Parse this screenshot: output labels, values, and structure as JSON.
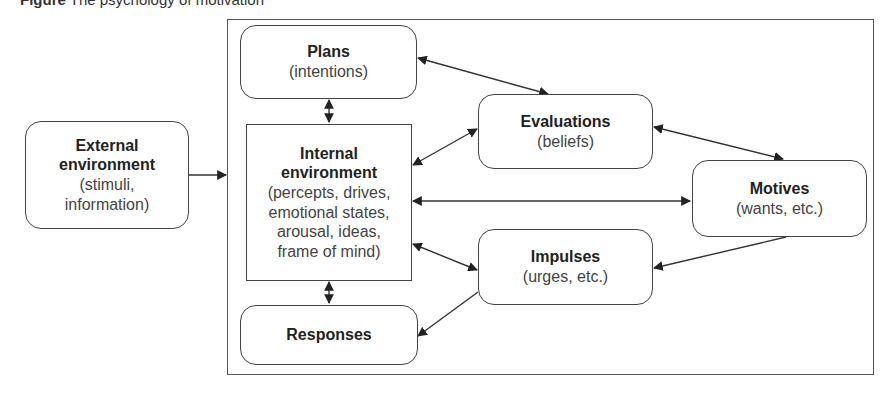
{
  "figure": {
    "title_prefix": "Figure",
    "title_text": "The psychology of motivation"
  },
  "nodes": {
    "external": {
      "heading": "External",
      "heading2": "environment",
      "sub1": "(stimuli,",
      "sub2": "information)"
    },
    "plans": {
      "heading": "Plans",
      "sub1": "(intentions)"
    },
    "internal": {
      "heading": "Internal",
      "heading2": "environment",
      "sub1": "(percepts, drives,",
      "sub2": "emotional states,",
      "sub3": "arousal, ideas,",
      "sub4": "frame of mind)"
    },
    "evaluations": {
      "heading": "Evaluations",
      "sub1": "(beliefs)"
    },
    "motives": {
      "heading": "Motives",
      "sub1": "(wants, etc.)"
    },
    "impulses": {
      "heading": "Impulses",
      "sub1": "(urges, etc.)"
    },
    "responses": {
      "heading": "Responses"
    }
  },
  "edges": [
    {
      "from": "External environment",
      "to": "Internal environment",
      "type": "one-way"
    },
    {
      "from": "Plans",
      "to": "Internal environment",
      "type": "two-way"
    },
    {
      "from": "Plans",
      "to": "Evaluations",
      "type": "two-way"
    },
    {
      "from": "Internal environment",
      "to": "Evaluations",
      "type": "two-way"
    },
    {
      "from": "Evaluations",
      "to": "Motives",
      "type": "two-way"
    },
    {
      "from": "Internal environment",
      "to": "Motives",
      "type": "two-way"
    },
    {
      "from": "Internal environment",
      "to": "Impulses",
      "type": "two-way"
    },
    {
      "from": "Motives",
      "to": "Impulses",
      "type": "one-way"
    },
    {
      "from": "Impulses",
      "to": "Responses",
      "type": "one-way"
    },
    {
      "from": "Internal environment",
      "to": "Responses",
      "type": "two-way"
    }
  ],
  "colors": {
    "stroke": "#444444",
    "text": "#222222",
    "background": "#ffffff"
  }
}
